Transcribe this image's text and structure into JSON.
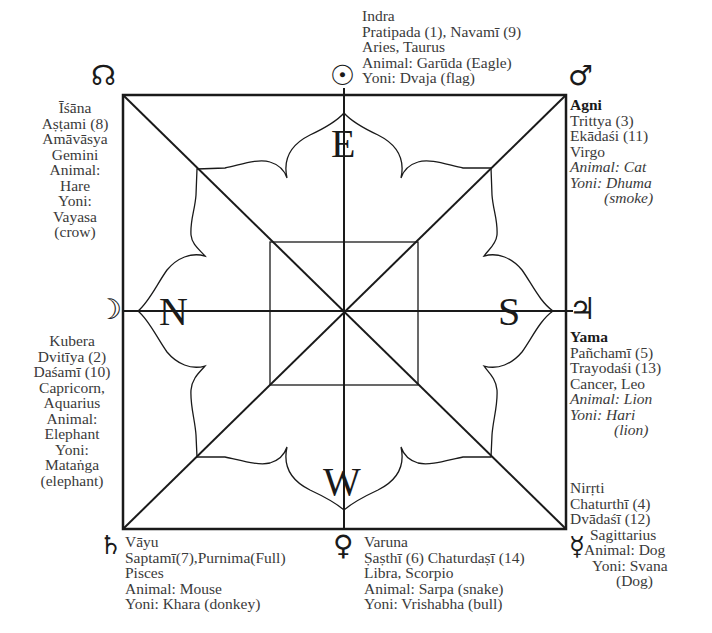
{
  "directions": {
    "east": "E",
    "north": "N",
    "south": "S",
    "west": "W"
  },
  "planets": {
    "north_node": {
      "glyph": "☊",
      "name": "rahu-north-node"
    },
    "sun": {
      "glyph": "☉",
      "name": "sun"
    },
    "mars": {
      "glyph": "♂",
      "name": "mars"
    },
    "moon": {
      "glyph": "☽",
      "name": "moon"
    },
    "jupiter": {
      "glyph": "♃",
      "name": "jupiter"
    },
    "saturn": {
      "glyph": "♄",
      "name": "saturn"
    },
    "venus": {
      "glyph": "♀",
      "name": "venus"
    },
    "mercury": {
      "glyph": "☿",
      "name": "mercury"
    }
  },
  "blocks": {
    "east": [
      "Indra",
      "Pratipada (1), Navamī (9)",
      "Aries, Taurus",
      "Animal: Garūda (Eagle)",
      "Yoni: Dvaja (flag)"
    ],
    "southeast": {
      "deity": "Agni",
      "lines": [
        "Trittya (3)",
        "Ekādaśi (11)",
        "Virgo"
      ],
      "italic_lines": [
        "Animal: Cat",
        "Yoni: Dhuma",
        "(smoke)"
      ]
    },
    "northeast": [
      "Īśāna",
      "Aṣṭami (8)",
      "Amāvāsya",
      "Gemini",
      "Animal:",
      "Hare",
      "Yoni:",
      "Vayasa",
      "(crow)"
    ],
    "north": [
      "Kubera",
      "Dvitīya (2)",
      "Daśamī (10)",
      "Capricorn,",
      "Aquarius",
      "Animal:",
      "Elephant",
      "Yoni:",
      "Mataṅga",
      "(elephant)"
    ],
    "south": {
      "deity": "Yama",
      "lines": [
        "Pañchamī (5)",
        "Trayodaśi (13)",
        "Cancer, Leo"
      ],
      "italic_lines": [
        "Animal: Lion",
        "Yoni: Hari",
        "(lion)"
      ]
    },
    "southwest": [
      "Nirṛti",
      "Chaturthī (4)",
      "Dvādaśī  (12)",
      "Sagittarius",
      "Animal: Dog",
      "Yoni: Svana",
      "(Dog)"
    ],
    "northwest": [
      "Vāyu",
      "Saptamī(7),Purnima(Full)",
      "Pisces",
      "Animal: Mouse",
      "Yoni: Khara (donkey)"
    ],
    "west": [
      "Varuna",
      "Ṣaṣthī (6) Chaturdaṣī (14)",
      "Libra, Scorpio",
      "Animal: Sarpa (snake)",
      "Yoni: Vrishabha (bull)"
    ]
  },
  "colors": {
    "line": "#1a1a1a",
    "text": "#3a3a3a",
    "background": "#ffffff"
  }
}
